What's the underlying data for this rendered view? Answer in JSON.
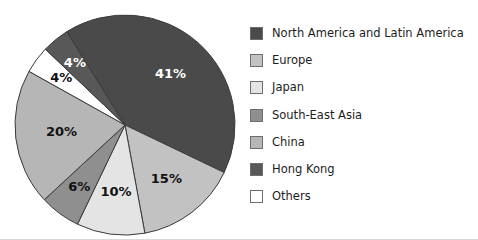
{
  "chart_data": {
    "type": "pie",
    "title": "",
    "subtitle": "",
    "xlabel": "",
    "ylabel": "",
    "grid": false,
    "legend_position": "right",
    "units": "percent",
    "total": 100,
    "categories": [
      "North America and Latin America",
      "Europe",
      "Japan",
      "South-East Asia",
      "China",
      "Hong Kong",
      "Others"
    ],
    "values": [
      41,
      15,
      10,
      6,
      20,
      4,
      4
    ],
    "data_labels": [
      "41%",
      "15%",
      "10%",
      "6%",
      "20%",
      "4%",
      "4%"
    ],
    "colors": [
      "#4a4a4a",
      "#c2c2c2",
      "#e4e4e4",
      "#8f8f8f",
      "#b6b6b6",
      "#585858",
      "#ffffff"
    ],
    "slices": [
      {
        "name": "North America and Latin America",
        "value": 41,
        "label": "41%",
        "color": "#4a4a4a",
        "label_color": "#ffffff",
        "start_angle": -32,
        "sweep_angle": 147.6,
        "label_radius_ratio": 0.62
      },
      {
        "name": "Europe",
        "value": 15,
        "label": "15%",
        "color": "#c2c2c2",
        "label_color": "#111111",
        "start_angle": 115.6,
        "sweep_angle": 54,
        "label_radius_ratio": 0.62
      },
      {
        "name": "Japan",
        "value": 10,
        "label": "10%",
        "color": "#e4e4e4",
        "label_color": "#111111",
        "start_angle": 169.6,
        "sweep_angle": 36,
        "label_radius_ratio": 0.62
      },
      {
        "name": "South-East Asia",
        "value": 6,
        "label": "6%",
        "color": "#8f8f8f",
        "label_color": "#111111",
        "start_angle": 205.6,
        "sweep_angle": 21.6,
        "label_radius_ratio": 0.7
      },
      {
        "name": "China",
        "value": 20,
        "label": "20%",
        "color": "#b6b6b6",
        "label_color": "#111111",
        "start_angle": 227.2,
        "sweep_angle": 72,
        "label_radius_ratio": 0.58
      },
      {
        "name": "Others",
        "value": 4,
        "label": "4%",
        "color": "#ffffff",
        "label_color": "#111111",
        "start_angle": 299.2,
        "sweep_angle": 14.4,
        "label_radius_ratio": 0.72
      },
      {
        "name": "Hong Kong",
        "value": 4,
        "label": "4%",
        "color": "#585858",
        "label_color": "#ffffff",
        "start_angle": 313.6,
        "sweep_angle": 14.4,
        "label_radius_ratio": 0.72
      }
    ],
    "geometry": {
      "center_x": 125,
      "center_y": 125,
      "radius": 110
    }
  },
  "legend": {
    "items": [
      {
        "label": "North America and Latin America",
        "color": "#4a4a4a"
      },
      {
        "label": "Europe",
        "color": "#c2c2c2"
      },
      {
        "label": "Japan",
        "color": "#e4e4e4"
      },
      {
        "label": "South-East Asia",
        "color": "#8f8f8f"
      },
      {
        "label": "China",
        "color": "#b6b6b6"
      },
      {
        "label": "Hong Kong",
        "color": "#585858"
      },
      {
        "label": "Others",
        "color": "#ffffff"
      }
    ]
  }
}
